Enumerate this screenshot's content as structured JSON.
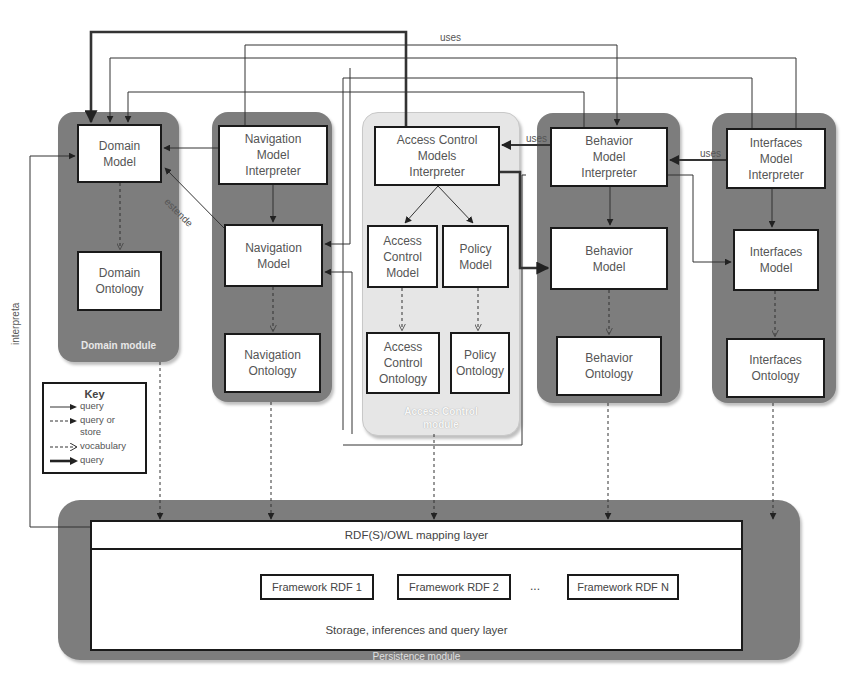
{
  "diagram": {
    "modules": [
      {
        "id": "domain",
        "label": "Domain module",
        "boxes": [
          {
            "id": "domain-model",
            "label": "Domain\nModel"
          },
          {
            "id": "domain-ontology",
            "label": "Domain\nOntology"
          }
        ]
      },
      {
        "id": "navigation",
        "label": "Navigation module",
        "boxes": [
          {
            "id": "nav-interpreter",
            "label": "Navigation\nModel\nInterpreter"
          },
          {
            "id": "nav-model",
            "label": "Navigation\nModel"
          },
          {
            "id": "nav-ontology",
            "label": "Navigation\nOntology"
          }
        ]
      },
      {
        "id": "access",
        "label": "Access Control\nmodule",
        "boxes": [
          {
            "id": "ac-interpreter",
            "label": "Access Control\nModels\nInterpreter"
          },
          {
            "id": "ac-model",
            "label": "Access\nControl\nModel"
          },
          {
            "id": "policy-model",
            "label": "Policy\nModel"
          },
          {
            "id": "ac-ontology",
            "label": "Access\nControl\nOntology"
          },
          {
            "id": "policy-ontology",
            "label": "Policy\nOntology"
          }
        ]
      },
      {
        "id": "behavior",
        "label": "Behavior module",
        "boxes": [
          {
            "id": "beh-interpreter",
            "label": "Behavior\nModel\nInterpreter"
          },
          {
            "id": "beh-model",
            "label": "Behavior\nModel"
          },
          {
            "id": "beh-ontology",
            "label": "Behavior\nOntology"
          }
        ]
      },
      {
        "id": "interface",
        "label": "Interface module",
        "boxes": [
          {
            "id": "int-interpreter",
            "label": "Interfaces\nModel\nInterpreter"
          },
          {
            "id": "int-model",
            "label": "Interfaces\nModel"
          },
          {
            "id": "int-ontology",
            "label": "Interfaces\nOntology"
          }
        ]
      }
    ],
    "persistence": {
      "label": "Persistence module",
      "mapping_layer": "RDF(S)/OWL mapping layer",
      "frameworks": [
        "Framework RDF 1",
        "Framework RDF 2",
        "Framework RDF N"
      ],
      "ellipsis": "...",
      "storage_layer": "Storage, inferences and query layer"
    },
    "edge_labels": {
      "uses_top": "uses",
      "uses_beh": "uses",
      "uses_int": "uses",
      "estende": "estende",
      "interpreta": "interpreta"
    },
    "key": {
      "title": "Key",
      "items": [
        {
          "style": "thin-solid",
          "label": "query"
        },
        {
          "style": "dashed-filled",
          "label": "query or\nstore"
        },
        {
          "style": "dashed-open",
          "label": "vocabulary"
        },
        {
          "style": "thick-solid",
          "label": "query"
        }
      ]
    },
    "colors": {
      "module_dark": "#7d7d7d",
      "module_light": "#e6e6e6",
      "box_border": "#1a1a1a",
      "line": "#333333"
    }
  }
}
